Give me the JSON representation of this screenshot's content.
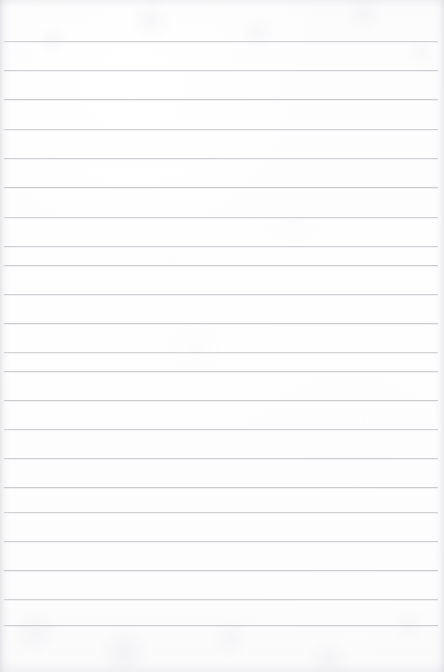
{
  "image": {
    "subject": "blank lined notebook paper",
    "width": 444,
    "height": 672,
    "background_color": "#fdfdfd",
    "rule_color": "#c9c9ce",
    "edge_shadow_color": "#c4c4cc"
  },
  "paper": {
    "rule_count": 21,
    "first_rule_y": 41,
    "rule_spacing": 29.2,
    "rule_thickness": 1,
    "left_margin": 4,
    "right_margin": 6,
    "top_margin": 41,
    "bottom_margin": 47,
    "rule_positions": [
      41,
      70,
      99,
      129,
      158,
      187,
      217,
      246,
      265,
      294,
      323,
      352,
      371,
      400,
      429,
      458,
      487,
      512,
      541,
      570,
      599,
      625
    ]
  },
  "specks": [
    {
      "x": 160,
      "y": 133,
      "size": 2,
      "opacity": 0.22
    },
    {
      "x": 276,
      "y": 58,
      "size": 2,
      "opacity": 0.18
    },
    {
      "x": 78,
      "y": 175,
      "size": 2,
      "opacity": 0.16
    },
    {
      "x": 338,
      "y": 175,
      "size": 2,
      "opacity": 0.15
    },
    {
      "x": 172,
      "y": 262,
      "size": 2,
      "opacity": 0.16
    },
    {
      "x": 363,
      "y": 418,
      "size": 2,
      "opacity": 0.18
    },
    {
      "x": 52,
      "y": 470,
      "size": 2,
      "opacity": 0.16
    },
    {
      "x": 234,
      "y": 530,
      "size": 2,
      "opacity": 0.14
    },
    {
      "x": 300,
      "y": 610,
      "size": 2,
      "opacity": 0.15
    },
    {
      "x": 118,
      "y": 350,
      "size": 2,
      "opacity": 0.13
    }
  ]
}
